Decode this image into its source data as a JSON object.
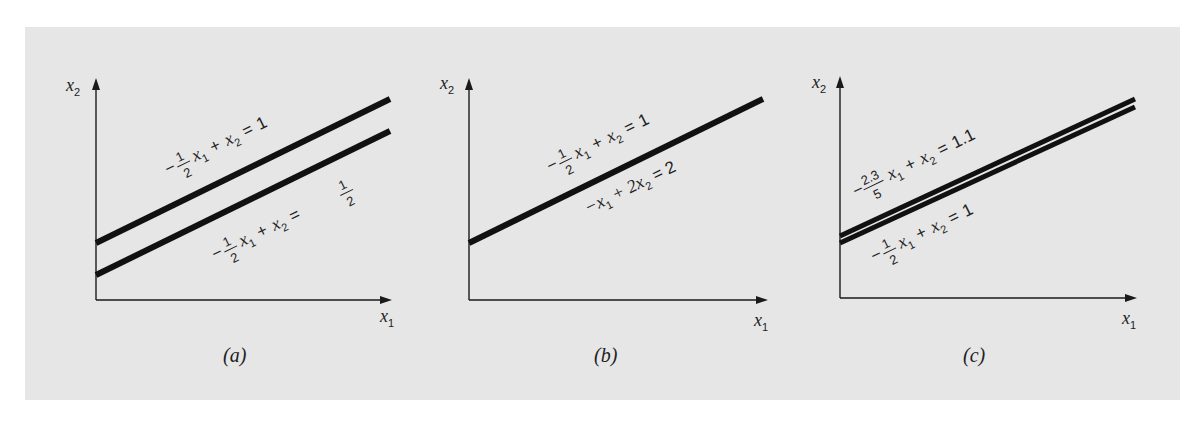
{
  "figure": {
    "background": "#e6e6e6",
    "line_color": "#111111",
    "panels": [
      {
        "caption": "(a)",
        "x_axis_label": "x",
        "x_axis_sub": "1",
        "y_axis_label": "x",
        "y_axis_sub": "2",
        "description": "Parallel lines — no solution",
        "equations": [
          {
            "coef_sign": "−",
            "coef_num": "1",
            "coef_den": "2",
            "var1": "x",
            "var1_sub": "1",
            "plus": "+",
            "var2": "x",
            "var2_sub": "2",
            "equals": "=",
            "rhs": "1"
          },
          {
            "coef_sign": "−",
            "coef_num": "1",
            "coef_den": "2",
            "var1": "x",
            "var1_sub": "1",
            "plus": "+",
            "var2": "x",
            "var2_sub": "2",
            "equals": "=",
            "rhs_num": "1",
            "rhs_den": "2"
          }
        ]
      },
      {
        "caption": "(b)",
        "x_axis_label": "x",
        "x_axis_sub": "1",
        "y_axis_label": "x",
        "y_axis_sub": "2",
        "description": "Coincident lines — infinite solutions",
        "equations": [
          {
            "coef_sign": "−",
            "coef_num": "1",
            "coef_den": "2",
            "var1": "x",
            "var1_sub": "1",
            "plus": "+",
            "var2": "x",
            "var2_sub": "2",
            "equals": "=",
            "rhs": "1"
          },
          {
            "text_a": "−x",
            "var1_sub": "1",
            "text_b": "+ 2x",
            "var2_sub": "2",
            "text_c": "= 2"
          }
        ]
      },
      {
        "caption": "(c)",
        "x_axis_label": "x",
        "x_axis_sub": "1",
        "y_axis_label": "x",
        "y_axis_sub": "2",
        "description": "Nearly parallel lines — ill-conditioned",
        "equations": [
          {
            "coef_sign": "−",
            "coef_num": "2.3",
            "coef_den": "5",
            "var1": "x",
            "var1_sub": "1",
            "plus": "+",
            "var2": "x",
            "var2_sub": "2",
            "equals": "=",
            "rhs": "1.1"
          },
          {
            "coef_sign": "−",
            "coef_num": "1",
            "coef_den": "2",
            "var1": "x",
            "var1_sub": "1",
            "plus": "+",
            "var2": "x",
            "var2_sub": "2",
            "equals": "=",
            "rhs": "1"
          }
        ]
      }
    ]
  }
}
